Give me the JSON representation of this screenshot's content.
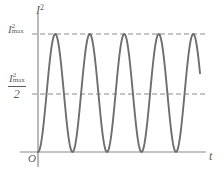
{
  "figure": {
    "axis_title_y": "I",
    "axis_title_y_exp": "2",
    "axis_title_x": "t",
    "origin": "O",
    "tick_max_base": "I",
    "tick_max_exp": "2",
    "tick_max_sub": "max",
    "tick_half_base": "I",
    "tick_half_exp": "2",
    "tick_half_sub": "max",
    "tick_half_denominator": "2",
    "colors": {
      "curve": "#6e6e6e",
      "axis": "#8a8a8a",
      "dashed": "#8a8a8a",
      "text": "#5d5d5d",
      "background": "#ffffff"
    }
  },
  "chart_data": {
    "type": "line",
    "title": "",
    "xlabel": "t",
    "ylabel": "I²",
    "grid": false,
    "legend": null,
    "axis_origin_px": {
      "x": 38,
      "y": 152
    },
    "xlim_px": [
      38,
      206
    ],
    "ylim_px": [
      152,
      34
    ],
    "ylim": [
      0,
      1
    ],
    "y_tick_values": [
      1,
      0.5
    ],
    "y_tick_labels": [
      "I²max",
      "I²max/2"
    ],
    "reference_lines": [
      {
        "label": "I²max",
        "y": 1,
        "style": "dashed"
      },
      {
        "label": "I²max/2",
        "y": 0.5,
        "style": "dashed"
      }
    ],
    "function": "I² = I²max * sin²(pi * t / T)",
    "amplitude": 1,
    "period_px": 34.5,
    "periods_shown": 5,
    "curve_start_x_px": 38,
    "curve_end_x_px": 200,
    "peaks_x_px": [
      55.2,
      89.7,
      124.2,
      158.7,
      193.2
    ],
    "peak_value": 1,
    "minima_x_px": [
      38,
      72.4,
      106.9,
      141.4,
      175.9
    ],
    "minimum_value": 0,
    "series": [
      {
        "name": "I squared",
        "x": [
          0,
          0.05,
          0.1,
          0.15,
          0.2,
          0.25,
          0.3,
          0.35,
          0.4,
          0.45,
          0.5,
          0.55,
          0.6,
          0.65,
          0.7,
          0.75,
          0.8,
          0.85,
          0.9,
          0.95,
          1.0
        ],
        "values": [
          0,
          0.024,
          0.095,
          0.206,
          0.345,
          0.5,
          0.655,
          0.794,
          0.905,
          0.976,
          1.0,
          0.976,
          0.905,
          0.794,
          0.655,
          0.5,
          0.345,
          0.206,
          0.095,
          0.024,
          0
        ]
      }
    ]
  }
}
